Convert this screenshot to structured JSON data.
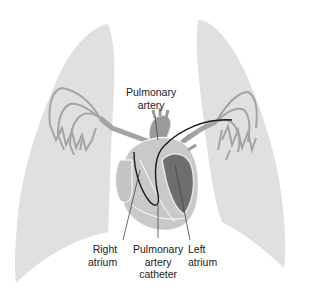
{
  "diagram": {
    "colors": {
      "lung": "#e0e0e0",
      "vessel": "#a4a4a4",
      "heart_light": "#c9c9c9",
      "heart_mid": "#9a9a9a",
      "heart_dark": "#6e6e6e",
      "catheter": "#1a1a1a",
      "leader_line": "#444444"
    },
    "labels": {
      "pulmonary_artery": {
        "line1": "Pulmonary",
        "line2": "artery"
      },
      "right_atrium": {
        "line1": "Right",
        "line2": "atrium"
      },
      "catheter": {
        "line1": "Pulmonary",
        "line2": "artery",
        "line3": "catheter"
      },
      "left_atrium": {
        "line1": "Left",
        "line2": "atrium"
      }
    },
    "structures": [
      "left-lung",
      "right-lung",
      "heart",
      "pulmonary-vessels",
      "catheter"
    ]
  }
}
